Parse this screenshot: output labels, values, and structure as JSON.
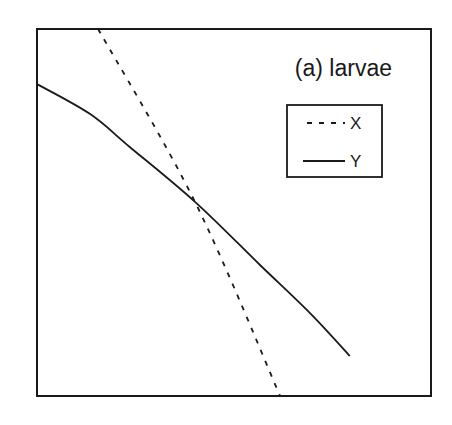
{
  "chart_data": {
    "type": "line",
    "title": "(a) larvae",
    "xlabel": "",
    "ylabel": "",
    "xlim": [
      0,
      1
    ],
    "ylim": [
      0,
      1
    ],
    "grid": false,
    "axis_ticks_visible": false,
    "legend_position": "upper right (inside plot)",
    "series": [
      {
        "name": "X",
        "style": "dashed",
        "x": [
          0.155,
          0.401,
          0.617
        ],
        "y": [
          1.0,
          0.529,
          0.0
        ]
      },
      {
        "name": "Y",
        "style": "solid",
        "x": [
          0.0,
          0.135,
          0.236,
          0.401,
          0.566,
          0.693,
          0.794
        ],
        "y": [
          0.85,
          0.768,
          0.678,
          0.529,
          0.357,
          0.226,
          0.109
        ]
      }
    ],
    "annotations": [
      "Lines X and Y intersect near (0.40, 0.53)"
    ]
  },
  "colors": {
    "line": "#1a1a1a",
    "background": "#ffffff"
  }
}
